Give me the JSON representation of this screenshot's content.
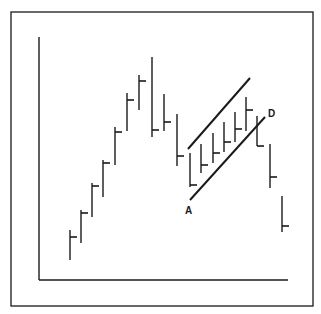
{
  "chart_data": {
    "type": "bar",
    "subtype": "ohlc-high-low-close",
    "title": "",
    "xlabel": "",
    "ylabel": "",
    "grid": false,
    "legend": null,
    "ink_color": "#1a1a1a",
    "background": "#ffffff",
    "frame": {
      "x": 11,
      "y": 12,
      "w": 302,
      "h": 294
    },
    "axes": {
      "x0": 39,
      "y_top": 37,
      "y_base": 280,
      "x_end": 288
    },
    "bars": [
      {
        "x": 70,
        "high": 230,
        "low": 260,
        "close": 237
      },
      {
        "x": 81,
        "high": 210,
        "low": 243,
        "close": 213
      },
      {
        "x": 92,
        "high": 183,
        "low": 217,
        "close": 186
      },
      {
        "x": 103,
        "high": 160,
        "low": 197,
        "close": 163
      },
      {
        "x": 115,
        "high": 127,
        "low": 165,
        "close": 132
      },
      {
        "x": 127,
        "high": 93,
        "low": 131,
        "close": 100
      },
      {
        "x": 139,
        "high": 75,
        "low": 110,
        "close": 81
      },
      {
        "x": 152,
        "high": 57,
        "low": 137,
        "close": 130
      },
      {
        "x": 164,
        "high": 94,
        "low": 131,
        "close": 122
      },
      {
        "x": 177,
        "high": 114,
        "low": 166,
        "close": 156
      },
      {
        "x": 190,
        "high": 153,
        "low": 187,
        "close": 185
      },
      {
        "x": 201,
        "high": 144,
        "low": 173,
        "close": 165
      },
      {
        "x": 213,
        "high": 133,
        "low": 163,
        "close": 153
      },
      {
        "x": 224,
        "high": 122,
        "low": 152,
        "close": 142
      },
      {
        "x": 235,
        "high": 112,
        "low": 142,
        "close": 129
      },
      {
        "x": 246,
        "high": 97,
        "low": 131,
        "close": 110
      },
      {
        "x": 257,
        "high": 116,
        "low": 146,
        "close": 146
      },
      {
        "x": 270,
        "high": 144,
        "low": 188,
        "close": 177
      },
      {
        "x": 282,
        "high": 196,
        "low": 232,
        "close": 226
      }
    ],
    "trendlines": [
      {
        "name": "upper-channel",
        "x1": 188,
        "y1": 149,
        "x2": 250,
        "y2": 78
      },
      {
        "name": "lower-channel",
        "x1": 190,
        "y1": 200,
        "x2": 265,
        "y2": 117
      }
    ],
    "annotations": [
      {
        "text": "A",
        "x": 185,
        "y": 214
      },
      {
        "text": "D",
        "x": 268,
        "y": 117
      }
    ]
  }
}
